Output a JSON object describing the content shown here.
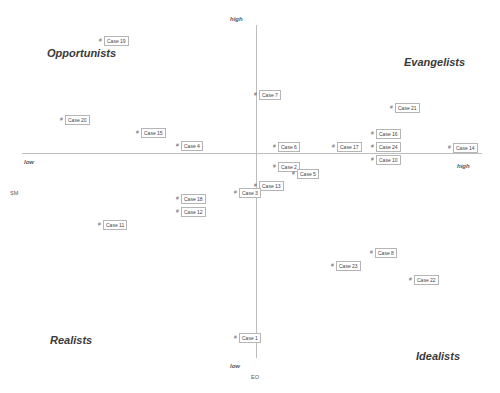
{
  "chart_data": {
    "type": "scatter",
    "title": "",
    "xlabel": "SM",
    "ylabel": "EO",
    "x_axis": {
      "low_label": "low",
      "high_label": "high"
    },
    "y_axis": {
      "low_label": "low",
      "high_label": "high"
    },
    "grid": false,
    "quadrants": {
      "top_left": "Opportunists",
      "top_right": "Evangelists",
      "bottom_left": "Realists",
      "bottom_right": "Idealists"
    },
    "points": [
      {
        "label": "Case 19",
        "px": 101,
        "py": 41
      },
      {
        "label": "Case 20",
        "px": 62,
        "py": 120
      },
      {
        "label": "Case 15",
        "px": 138,
        "py": 133
      },
      {
        "label": "Case 4",
        "px": 178,
        "py": 146
      },
      {
        "label": "Case 7",
        "px": 256,
        "py": 95
      },
      {
        "label": "Case 6",
        "px": 275,
        "py": 147
      },
      {
        "label": "Case 17",
        "px": 334,
        "py": 147
      },
      {
        "label": "Case 21",
        "px": 392,
        "py": 108
      },
      {
        "label": "Case 16",
        "px": 373,
        "py": 134
      },
      {
        "label": "Case 24",
        "px": 373,
        "py": 147
      },
      {
        "label": "Case 10",
        "px": 373,
        "py": 160
      },
      {
        "label": "Case 14",
        "px": 450,
        "py": 148
      },
      {
        "label": "Case 2",
        "px": 275,
        "py": 167
      },
      {
        "label": "Case 5",
        "px": 294,
        "py": 174
      },
      {
        "label": "Case 13",
        "px": 256,
        "py": 186
      },
      {
        "label": "Case 3",
        "px": 236,
        "py": 193
      },
      {
        "label": "Case 18",
        "px": 178,
        "py": 199
      },
      {
        "label": "Case 12",
        "px": 178,
        "py": 212
      },
      {
        "label": "Case 11",
        "px": 100,
        "py": 225
      },
      {
        "label": "Case 8",
        "px": 372,
        "py": 253
      },
      {
        "label": "Case 23",
        "px": 333,
        "py": 266
      },
      {
        "label": "Case 22",
        "px": 411,
        "py": 280
      },
      {
        "label": "Case 1",
        "px": 236,
        "py": 338
      }
    ],
    "marker_glyph": "#"
  }
}
